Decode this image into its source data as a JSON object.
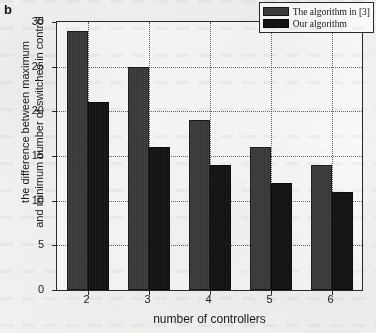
{
  "panel": {
    "label": "b"
  },
  "chart_data": {
    "type": "bar",
    "title": "",
    "xlabel": "number of controllers",
    "ylabel_lines": [
      "the difference between maximum",
      "and minimum number of switches in control"
    ],
    "categories": [
      "2",
      "3",
      "4",
      "5",
      "6"
    ],
    "series": [
      {
        "name": "The algorithm in [3]",
        "values": [
          29,
          25,
          19,
          16,
          14
        ],
        "color": "#3b3b3b"
      },
      {
        "name": "Our algorithm",
        "values": [
          21,
          16,
          14,
          12,
          11
        ],
        "color": "#141414"
      }
    ],
    "ylim": [
      0,
      30
    ],
    "yticks": [
      0,
      5,
      10,
      15,
      20,
      25,
      30
    ],
    "ytick_labels": [
      "0",
      "5",
      "10",
      "15",
      "20",
      "25",
      "30"
    ],
    "grid": true,
    "grid_style": "dotted",
    "legend_position": "top-right"
  }
}
